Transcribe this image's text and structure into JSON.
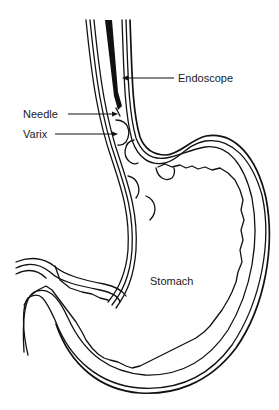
{
  "diagram": {
    "labels": {
      "endoscope": "Endoscope",
      "needle": "Needle",
      "varix": "Varix",
      "stomach": "Stomach"
    },
    "colors": {
      "line": "#111111",
      "background": "#ffffff",
      "text": "#1a1a1a"
    }
  }
}
